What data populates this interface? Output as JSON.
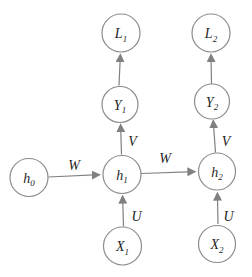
{
  "diagram": {
    "type": "graph",
    "nodes": {
      "h0": {
        "label": "h",
        "sub": "0"
      },
      "h1": {
        "label": "h",
        "sub": "1"
      },
      "h2": {
        "label": "h",
        "sub": "2"
      },
      "x1": {
        "label": "X",
        "sub": "1"
      },
      "x2": {
        "label": "X",
        "sub": "2"
      },
      "y1": {
        "label": "Y",
        "sub": "1"
      },
      "y2": {
        "label": "Y",
        "sub": "2"
      },
      "l1": {
        "label": "L",
        "sub": "1"
      },
      "l2": {
        "label": "L",
        "sub": "2"
      }
    },
    "edges": [
      {
        "id": "h0-h1",
        "from": "h0",
        "to": "h1",
        "label": "W"
      },
      {
        "id": "h1-h2",
        "from": "h1",
        "to": "h2",
        "label": "W"
      },
      {
        "id": "x1-h1",
        "from": "x1",
        "to": "h1",
        "label": "U"
      },
      {
        "id": "x2-h2",
        "from": "x2",
        "to": "h2",
        "label": "U"
      },
      {
        "id": "h1-y1",
        "from": "h1",
        "to": "y1",
        "label": "V"
      },
      {
        "id": "h2-y2",
        "from": "h2",
        "to": "y2",
        "label": "V"
      },
      {
        "id": "y1-l1",
        "from": "y1",
        "to": "l1",
        "label": ""
      },
      {
        "id": "y2-l2",
        "from": "y2",
        "to": "l2",
        "label": ""
      }
    ],
    "colors": {
      "node_stroke": "#8c8c8c",
      "arrow": "#808080",
      "text": "#1f1f1f",
      "background": "#ffffff"
    }
  }
}
